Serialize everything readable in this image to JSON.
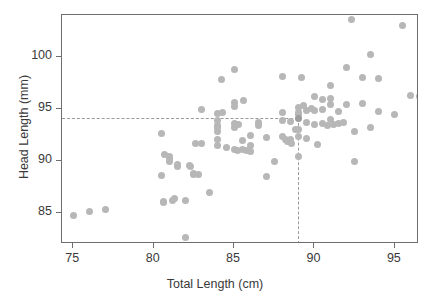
{
  "chart_data": {
    "type": "scatter",
    "title": "",
    "xlabel": "Total Length (cm)",
    "ylabel": "Head Length (mm)",
    "xlim": [
      74.3,
      96.5
    ],
    "ylim": [
      82.0,
      104.0
    ],
    "xticks": [
      75,
      80,
      85,
      90,
      95
    ],
    "yticks": [
      85,
      90,
      95,
      100
    ],
    "xtick_labels": [
      "75",
      "80",
      "85",
      "90",
      "95"
    ],
    "ytick_labels": [
      "85",
      "90",
      "95",
      "100"
    ],
    "grid": false,
    "legend": null,
    "point_color": "#b7b7b7",
    "guide_color": "#9a9a9a",
    "frame_color": "#6e6e6e",
    "annotations": {
      "guide_h_value": 94.1,
      "guide_v_value": 89.0,
      "guide_style": "dashed",
      "description": "Dashed reference lines marking total length 89 cm and head length 94.1 mm"
    },
    "x": [
      75.0,
      76.0,
      77.0,
      80.5,
      80.5,
      80.6,
      80.6,
      80.7,
      81.0,
      81.0,
      81.0,
      81.2,
      81.3,
      81.5,
      81.5,
      82.0,
      82.0,
      82.2,
      82.3,
      82.5,
      82.5,
      82.6,
      82.8,
      83.0,
      83.0,
      83.5,
      84.0,
      84.0,
      84.0,
      84.0,
      84.0,
      84.0,
      84.0,
      84.2,
      84.3,
      84.5,
      85.0,
      85.0,
      85.0,
      85.0,
      85.0,
      85.0,
      85.2,
      85.3,
      85.5,
      85.5,
      85.6,
      85.8,
      86.0,
      86.0,
      86.0,
      86.5,
      86.5,
      87.0,
      87.0,
      87.5,
      88.0,
      88.0,
      88.0,
      88.0,
      88.2,
      88.3,
      88.5,
      88.5,
      88.6,
      88.8,
      89.0,
      89.0,
      89.0,
      89.0,
      89.0,
      89.0,
      89.0,
      89.2,
      89.3,
      89.5,
      89.5,
      89.5,
      89.8,
      90.0,
      90.0,
      90.0,
      90.2,
      90.5,
      90.5,
      90.5,
      90.8,
      91.0,
      91.0,
      91.0,
      91.0,
      91.2,
      91.5,
      91.5,
      91.8,
      92.0,
      92.0,
      92.3,
      92.5,
      92.5,
      93.0,
      93.0,
      93.5,
      93.5,
      94.0,
      94.0,
      95.0,
      95.5,
      96.0,
      96.5
    ],
    "y": [
      84.7,
      85.1,
      85.3,
      92.6,
      88.6,
      86.1,
      86.0,
      90.6,
      90.4,
      90.2,
      89.9,
      86.2,
      86.4,
      89.6,
      89.4,
      82.6,
      86.2,
      89.5,
      89.4,
      88.8,
      88.7,
      91.7,
      88.7,
      94.9,
      91.7,
      86.9,
      94.5,
      93.9,
      93.4,
      93.2,
      92.8,
      92.0,
      91.5,
      97.8,
      94.6,
      91.3,
      98.8,
      95.6,
      95.2,
      93.6,
      93.2,
      91.1,
      91.0,
      93.5,
      91.9,
      91.1,
      95.8,
      91.0,
      92.4,
      91.5,
      90.9,
      93.7,
      93.4,
      92.2,
      88.5,
      89.9,
      98.1,
      94.6,
      93.9,
      92.3,
      92.0,
      91.8,
      93.8,
      92.0,
      91.7,
      93.0,
      95.1,
      94.6,
      94.4,
      94.1,
      93.0,
      92.3,
      90.4,
      98.0,
      95.3,
      94.8,
      93.7,
      92.1,
      95.0,
      96.2,
      94.8,
      93.5,
      91.6,
      95.9,
      94.9,
      93.6,
      93.4,
      97.2,
      96.0,
      95.4,
      94.0,
      93.5,
      94.7,
      93.6,
      93.7,
      99.0,
      95.4,
      103.6,
      92.8,
      89.9,
      98.0,
      95.5,
      100.2,
      93.2,
      97.9,
      94.7,
      94.4,
      103.0,
      96.3,
      96.2
    ]
  },
  "axes": {
    "x_title": "Total Length (cm)",
    "y_title": "Head Length (mm)"
  }
}
